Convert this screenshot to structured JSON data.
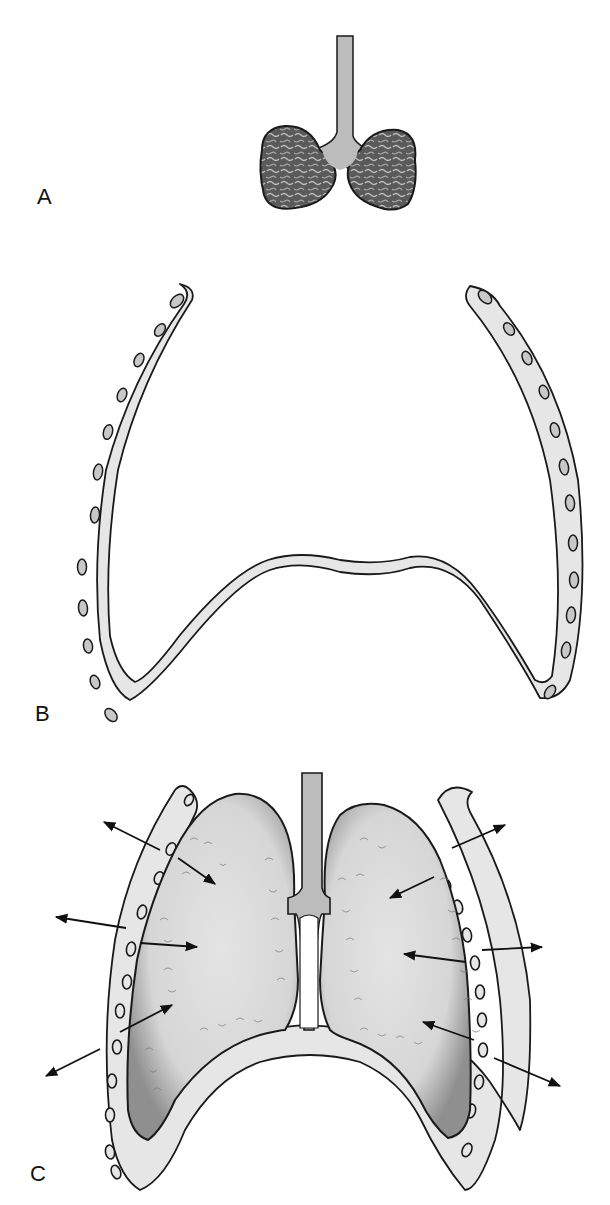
{
  "figure": {
    "panels": [
      {
        "id": "A",
        "label": "A",
        "description": "Collapsed lungs with trachea (removed from thorax)"
      },
      {
        "id": "B",
        "label": "B",
        "description": "Empty chest wall (ribs) and diaphragm, expanded at rest"
      },
      {
        "id": "C",
        "label": "C",
        "description": "Lungs within thorax; opposing recoil forces of lungs (inward) and chest wall (outward)"
      }
    ],
    "arrows": {
      "outward_count": 6,
      "inward_count": 6,
      "meaning_outward": "chest wall tendency to spring outward",
      "meaning_inward": "lung elastic recoil inward"
    }
  },
  "colors": {
    "background": "#ffffff",
    "outline": "#1a1a1a",
    "bone_fill": "#e6e6e6",
    "rib_hole_fill": "#c8c8c8",
    "collapsed_lung_fill": "#5a5a5a",
    "collapsed_lung_texture": "#bdbdbd",
    "inflated_lung_fill": "#d9d9d9",
    "inflated_lung_edge": "#9a9a9a",
    "trachea_fill": "#bcbcbc",
    "arrow": "#111111"
  }
}
